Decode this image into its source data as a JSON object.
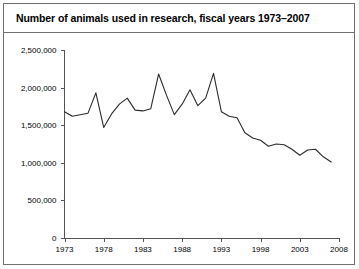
{
  "figure": {
    "title": "Number of animals used in research, fiscal years 1973–2007"
  },
  "chart_data": {
    "type": "line",
    "title": "Number of animals used in research, fiscal years 1973–2007",
    "xlabel": "",
    "ylabel": "",
    "xlim": [
      1973,
      2008
    ],
    "ylim": [
      0,
      2500000
    ],
    "grid": false,
    "legend": null,
    "legend_position": "none",
    "y_tick_labels": [
      "0",
      "500,000",
      "1,000,000",
      "1,500,000",
      "2,000,000",
      "2,500,000"
    ],
    "y_tick_values": [
      0,
      500000,
      1000000,
      1500000,
      2000000,
      2500000
    ],
    "x_tick_labels": [
      "1973",
      "1978",
      "1983",
      "1988",
      "1993",
      "1998",
      "2003",
      "2008"
    ],
    "x_tick_values": [
      1973,
      1978,
      1983,
      1988,
      1993,
      1998,
      2003,
      2008
    ],
    "line_color": "#2b2b2b",
    "x": [
      1973,
      1974,
      1975,
      1976,
      1977,
      1978,
      1979,
      1980,
      1981,
      1982,
      1983,
      1984,
      1985,
      1986,
      1987,
      1988,
      1989,
      1990,
      1991,
      1992,
      1993,
      1994,
      1995,
      1996,
      1997,
      1998,
      1999,
      2000,
      2001,
      2002,
      2003,
      2004,
      2005,
      2006,
      2007
    ],
    "values": [
      1680000,
      1620000,
      1640000,
      1660000,
      1930000,
      1470000,
      1650000,
      1780000,
      1860000,
      1700000,
      1690000,
      1720000,
      2180000,
      1900000,
      1640000,
      1780000,
      1970000,
      1760000,
      1860000,
      2190000,
      1680000,
      1620000,
      1600000,
      1400000,
      1330000,
      1300000,
      1220000,
      1250000,
      1240000,
      1180000,
      1100000,
      1170000,
      1180000,
      1080000,
      1010000
    ]
  }
}
